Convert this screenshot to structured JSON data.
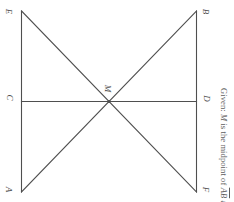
{
  "figure": {
    "orientation_degrees": 90,
    "stroke_color": "#4f4f4f",
    "background_color": "#ffffff",
    "vertices": [
      {
        "id": "E",
        "label": "E",
        "x": 21,
        "y": 11,
        "label_x": 8,
        "label_y": 8
      },
      {
        "id": "B",
        "label": "B",
        "x": 197,
        "y": 11,
        "label_x": 205,
        "label_y": 8
      },
      {
        "id": "C",
        "label": "C",
        "x": 21,
        "y": 101,
        "label_x": 8,
        "label_y": 94
      },
      {
        "id": "M",
        "label": "M",
        "x": 109,
        "y": 101,
        "label_x": 107,
        "label_y": 86
      },
      {
        "id": "D",
        "label": "D",
        "x": 197,
        "y": 101,
        "label_x": 205,
        "label_y": 95
      },
      {
        "id": "A",
        "label": "A",
        "x": 21,
        "y": 192,
        "label_x": 8,
        "label_y": 186
      },
      {
        "id": "F",
        "label": "F",
        "x": 197,
        "y": 192,
        "label_x": 205,
        "label_y": 186
      }
    ],
    "segments": [
      {
        "name": "segment-EA",
        "from": "E",
        "to": "A"
      },
      {
        "name": "segment-BF",
        "from": "B",
        "to": "F"
      },
      {
        "name": "segment-CD",
        "from": "C",
        "to": "D"
      },
      {
        "name": "segment-EF",
        "from": "E",
        "to": "F"
      },
      {
        "name": "segment-AB",
        "from": "A",
        "to": "B"
      }
    ],
    "caption": {
      "prefix": "Given:",
      "subject": "M",
      "text_before_bar1": "is the midpoint of",
      "bar1": "AB",
      "conjunction": "and",
      "bar2": "CD",
      "full_text": "Given: M is the midpoint of AB and CD"
    }
  }
}
